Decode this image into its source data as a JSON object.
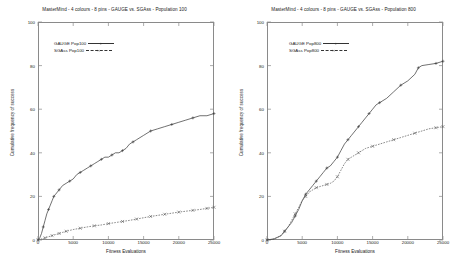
{
  "chart_data": [
    {
      "type": "line",
      "panel": "left",
      "title": "MasterMind - 4 colours - 8 pins - GAUGE vs. SGAss - Population 100",
      "xlabel": "Fitness Evaluations",
      "ylabel": "Cumulative frequency of success",
      "xlim": [
        0,
        25000
      ],
      "ylim": [
        0,
        100
      ],
      "xticks": [
        0,
        5000,
        10000,
        15000,
        20000,
        25000
      ],
      "xtick_labels": [
        "0",
        "5000",
        "10000",
        "15000",
        "20000",
        "25000"
      ],
      "yticks": [
        0,
        20,
        40,
        60,
        80,
        100
      ],
      "ytick_labels": [
        "0",
        "20",
        "40",
        "60",
        "80",
        "100"
      ],
      "grid": false,
      "legend_position": "upper left",
      "series": [
        {
          "name": "GAUGE Pop100",
          "marker": "plus",
          "linestyle": "solid",
          "color": "#333333",
          "x": [
            0,
            250,
            500,
            750,
            1000,
            1250,
            1500,
            1750,
            2000,
            2250,
            2500,
            2750,
            3000,
            3500,
            4000,
            4500,
            5000,
            5500,
            6000,
            6500,
            7000,
            7500,
            8000,
            8500,
            9000,
            9500,
            10000,
            10500,
            11000,
            11500,
            12000,
            12500,
            13000,
            13500,
            14000,
            15000,
            16000,
            17000,
            18000,
            19000,
            20000,
            21000,
            22000,
            23000,
            24000,
            25000
          ],
          "y": [
            0,
            1,
            3,
            6,
            9,
            12,
            14,
            16,
            18,
            20,
            21,
            22,
            23,
            25,
            26,
            27,
            28,
            30,
            31,
            32,
            33,
            34,
            35,
            36,
            37,
            38,
            38,
            39,
            40,
            40,
            41,
            42,
            44,
            45,
            46,
            48,
            50,
            51,
            52,
            53,
            54,
            55,
            56,
            57,
            57,
            58
          ]
        },
        {
          "name": "SGAss Pop100",
          "marker": "cross",
          "linestyle": "dashed",
          "color": "#555555",
          "x": [
            0,
            500,
            1000,
            1500,
            2000,
            2500,
            3000,
            3500,
            4000,
            5000,
            6000,
            7000,
            8000,
            9000,
            10000,
            11000,
            12000,
            13000,
            14000,
            15000,
            16000,
            17000,
            18000,
            19000,
            20000,
            21000,
            22000,
            23000,
            24000,
            25000
          ],
          "y": [
            0,
            0.5,
            1,
            1.5,
            2,
            2.5,
            3,
            3.5,
            4,
            4.8,
            5.4,
            6,
            6.5,
            6.9,
            7.5,
            8,
            8.5,
            9,
            9.6,
            10.2,
            10.8,
            11.3,
            11.8,
            12.3,
            12.8,
            13.2,
            13.6,
            14,
            14.5,
            15
          ]
        }
      ]
    },
    {
      "type": "line",
      "panel": "right",
      "title": "MasterMind - 4 colours - 8 pins - GAUGE vs. SGAss - Population 800",
      "xlabel": "Fitness Evaluations",
      "ylabel": "Cumulative frequency of success",
      "xlim": [
        0,
        25000
      ],
      "ylim": [
        0,
        100
      ],
      "xticks": [
        0,
        5000,
        10000,
        15000,
        20000,
        25000
      ],
      "xtick_labels": [
        "0",
        "5000",
        "10000",
        "15000",
        "20000",
        "25000"
      ],
      "yticks": [
        0,
        20,
        40,
        60,
        80,
        100
      ],
      "ytick_labels": [
        "0",
        "20",
        "40",
        "60",
        "80",
        "100"
      ],
      "grid": false,
      "legend_position": "upper left",
      "series": [
        {
          "name": "GAUGE Pop800",
          "marker": "plus",
          "linestyle": "solid",
          "color": "#333333",
          "x": [
            0,
            1000,
            2000,
            2500,
            3000,
            3500,
            4000,
            4500,
            5000,
            5500,
            6000,
            6500,
            7000,
            7500,
            8000,
            8500,
            9000,
            9500,
            10000,
            10500,
            11000,
            11500,
            12000,
            12500,
            13000,
            13500,
            14000,
            14500,
            15000,
            15500,
            16000,
            17000,
            18000,
            19000,
            20000,
            21000,
            21500,
            22000,
            23000,
            24000,
            25000
          ],
          "y": [
            0,
            0.5,
            2,
            4,
            6,
            8,
            11,
            14,
            18,
            21,
            23,
            25,
            27,
            29,
            31,
            33,
            34,
            36,
            38,
            41,
            44,
            46,
            48,
            50,
            52,
            54,
            56,
            58,
            60,
            62,
            63,
            65,
            68,
            71,
            73,
            76,
            79,
            80,
            80.5,
            81,
            82
          ]
        },
        {
          "name": "SGAss Pop800",
          "marker": "cross",
          "linestyle": "dashed",
          "color": "#555555",
          "x": [
            0,
            1000,
            2000,
            2500,
            3000,
            3500,
            4000,
            4500,
            5000,
            5500,
            6000,
            6500,
            7000,
            7500,
            8000,
            8500,
            9000,
            9500,
            10000,
            10500,
            11000,
            11500,
            12000,
            12500,
            13000,
            13500,
            14000,
            15000,
            16000,
            17000,
            18000,
            19000,
            20000,
            21000,
            22000,
            23000,
            24000,
            25000
          ],
          "y": [
            0,
            0.5,
            2,
            4,
            6,
            9,
            12,
            15,
            18,
            20,
            22,
            23,
            24,
            24.5,
            25,
            25.5,
            26,
            27,
            29,
            32,
            35,
            37,
            38,
            39,
            40,
            41,
            42,
            43,
            44,
            45,
            46,
            47,
            48,
            49,
            50,
            51,
            51.5,
            52
          ]
        }
      ]
    }
  ]
}
